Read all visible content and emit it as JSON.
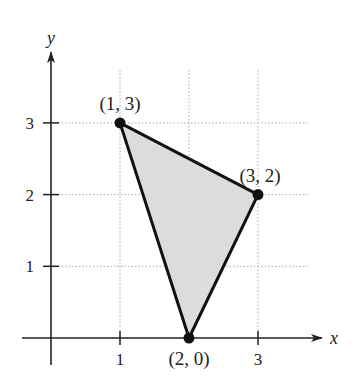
{
  "chart_data": {
    "type": "scatter",
    "title": "",
    "xlabel": "x",
    "ylabel": "y",
    "xlim": [
      0,
      3.5
    ],
    "ylim": [
      0,
      3.5
    ],
    "grid": true,
    "x_ticks": [
      {
        "value": 1,
        "label": "1"
      },
      {
        "value": 3,
        "label": "3"
      }
    ],
    "y_ticks": [
      {
        "value": 1,
        "label": "1"
      },
      {
        "value": 2,
        "label": "2"
      },
      {
        "value": 3,
        "label": "3"
      }
    ],
    "series": [
      {
        "name": "triangle",
        "shape": "filled-polygon",
        "fill": "#dcdcdc",
        "stroke": "#111111",
        "points": [
          {
            "x": 1,
            "y": 3,
            "label": "(1, 3)"
          },
          {
            "x": 3,
            "y": 2,
            "label": "(3, 2)"
          },
          {
            "x": 2,
            "y": 0,
            "label": "(2, 0)"
          }
        ]
      }
    ],
    "annotations": [
      "(1, 3)",
      "(3, 2)",
      "(2, 0)"
    ]
  }
}
